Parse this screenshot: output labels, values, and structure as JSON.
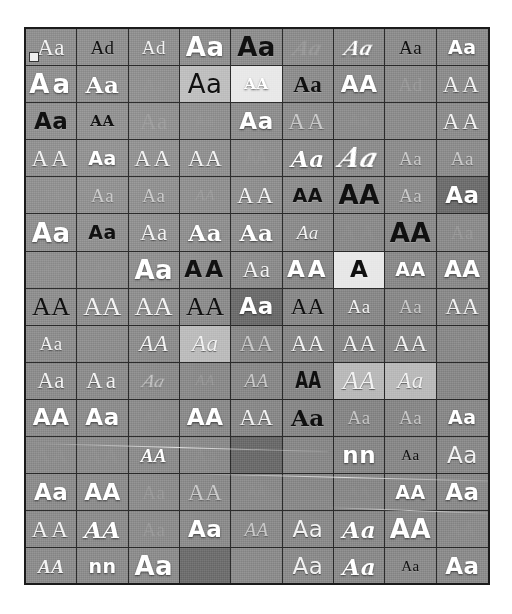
{
  "window": {
    "title": "Font Gallery",
    "panel_name": "font-preview-grid",
    "background_color": "#ffffff",
    "panel_background_color": "#8d8d8d",
    "grid_line_color": "#2a2a2a",
    "frame_border_color": "#1b1b1b"
  },
  "grid": {
    "columns": 9,
    "rows": 15,
    "total_cells": 135,
    "filled_cells": 130,
    "empty_cells": 5,
    "sample_text_default": "Aa",
    "selected_index": 0,
    "selection_badge_name": "selection-marker"
  },
  "cells": [
    {
      "text": "Aa",
      "cls": "f-serif sz-lg t-white"
    },
    {
      "text": "Ad",
      "cls": "f-serif sz-md t-dark"
    },
    {
      "text": "Ad",
      "cls": "f-serif sz-md t-white"
    },
    {
      "text": "Aa",
      "cls": "f-dsans w-bold sz-xl t-bright"
    },
    {
      "text": "Aa",
      "cls": "f-dsans w-bold sz-xl t-dark"
    },
    {
      "text": "Aa",
      "cls": "f-serif i-italic w-bold sz-lg t-faint slant"
    },
    {
      "text": "Aa",
      "cls": "f-serif i-italic w-bold sz-lg t-bright slant"
    },
    {
      "text": "Aa",
      "cls": "f-serif sz-md t-dark"
    },
    {
      "text": "Aa",
      "cls": "f-dsans w-bold sz-md t-bright"
    },
    {
      "text": "Aa",
      "cls": "f-dsans w-bold sz-xl t-bright wide"
    },
    {
      "text": "Aa",
      "cls": "f-dserif w-bold sz-lg t-bright"
    },
    {
      "text": "Aa",
      "cls": "f-serif sz-md t-ghost"
    },
    {
      "text": "Aa",
      "cls": "f-dsans sz-xl t-dark bg-lighter"
    },
    {
      "text": "AA",
      "cls": "f-dserif w-bold sz-sm t-bright bg-light"
    },
    {
      "text": "Aa",
      "cls": "f-serif w-bold sz-lg t-dark"
    },
    {
      "text": "AA",
      "cls": "f-dsans w-bold sz-lg t-bright"
    },
    {
      "text": "Ad",
      "cls": "f-serif sz-md t-faint"
    },
    {
      "text": "AA",
      "cls": "f-serif sz-lg t-white wide"
    },
    {
      "text": "Aa",
      "cls": "f-dsans w-bold sz-lg t-dark"
    },
    {
      "text": "AA",
      "cls": "f-dserif w-bold sz-sm t-dark blurry"
    },
    {
      "text": "Aa",
      "cls": "f-serif sz-lg t-faint"
    },
    {
      "text": "Aa",
      "cls": "f-dmono sz-sm t-ghost"
    },
    {
      "text": "Aa",
      "cls": "f-dsans w-bold sz-lg t-bright"
    },
    {
      "text": "AA",
      "cls": "f-serif sz-lg t-mid wide"
    },
    {
      "text": "Aa",
      "cls": "f-dsans sz-sm t-ghost"
    },
    {
      "text": "",
      "cls": "f-serif sz-sm t-ghost"
    },
    {
      "text": "AA",
      "cls": "f-serif sz-lg t-white wide"
    },
    {
      "text": "AA",
      "cls": "f-serif sz-lg t-white wide"
    },
    {
      "text": "Aa",
      "cls": "f-dsans w-bold sz-md t-bright"
    },
    {
      "text": "AA",
      "cls": "f-serif sz-lg t-white wide"
    },
    {
      "text": "AA",
      "cls": "f-serif sz-lg t-white"
    },
    {
      "text": "AA",
      "cls": "f-mono sz-lg t-ghost cond"
    },
    {
      "text": "Aa",
      "cls": "f-dserif i-italic w-bold sz-lg t-bright"
    },
    {
      "text": "Aa",
      "cls": "f-dserif i-italic w-bold sz-xl t-bright slant"
    },
    {
      "text": "Aa",
      "cls": "f-serif sz-md t-mid"
    },
    {
      "text": "Aa",
      "cls": "f-serif sz-md t-mid"
    },
    {
      "text": "AA",
      "cls": "f-serif i-italic sz-sm t-ghost"
    },
    {
      "text": "Aa",
      "cls": "f-serif sz-md t-mid"
    },
    {
      "text": "Aa",
      "cls": "f-serif sz-md t-mid"
    },
    {
      "text": "AA",
      "cls": "f-serif i-italic sz-sm t-faint"
    },
    {
      "text": "AA",
      "cls": "f-serif sz-lg t-white wide"
    },
    {
      "text": "AA",
      "cls": "f-dsans w-bold sz-md t-dark"
    },
    {
      "text": "AA",
      "cls": "f-dsans w-bold sz-xl t-dark"
    },
    {
      "text": "Aa",
      "cls": "f-serif sz-md t-mid"
    },
    {
      "text": "Aa",
      "cls": "f-dsans w-bold sz-lg t-bright bg-dark"
    },
    {
      "text": "Aa",
      "cls": "f-dsans w-bold sz-xl t-bright"
    },
    {
      "text": "Aa",
      "cls": "f-dsans w-bold sz-md t-dark"
    },
    {
      "text": "Aa",
      "cls": "f-serif sz-lg t-white"
    },
    {
      "text": "Aa",
      "cls": "f-dserif w-bold sz-lg t-bright"
    },
    {
      "text": "Aa",
      "cls": "f-dserif w-bold sz-lg t-bright"
    },
    {
      "text": "Aa",
      "cls": "f-serif i-italic sz-md t-white"
    },
    {
      "text": "AA",
      "cls": "f-serif sz-lg t-ghost wide"
    },
    {
      "text": "AA",
      "cls": "f-dsans w-bold sz-xl t-dark"
    },
    {
      "text": "Aa",
      "cls": "f-serif sz-md t-faint"
    },
    {
      "text": "Ad",
      "cls": "f-serif sz-sm t-ghost"
    },
    {
      "text": "Aa",
      "cls": "f-serif sz-sm t-ghost"
    },
    {
      "text": "Aa",
      "cls": "f-dsans w-bold sz-xl t-bright"
    },
    {
      "text": "AA",
      "cls": "f-dsans w-bold sz-lg t-dark wide"
    },
    {
      "text": "Aa",
      "cls": "f-serif sz-lg t-white"
    },
    {
      "text": "AA",
      "cls": "f-dsans w-bold sz-lg t-bright wide"
    },
    {
      "text": "A",
      "cls": "f-dsans w-bold sz-lg t-dark bg-light"
    },
    {
      "text": "AA",
      "cls": "f-dsans w-bold sz-md t-bright"
    },
    {
      "text": "AA",
      "cls": "f-dsans w-bold sz-lg t-bright"
    },
    {
      "text": "AA",
      "cls": "f-serif sz-xl t-dark"
    },
    {
      "text": "AA",
      "cls": "f-serif sz-xl t-white"
    },
    {
      "text": "AA",
      "cls": "f-serif sz-xl t-white"
    },
    {
      "text": "AA",
      "cls": "f-serif sz-xl t-dark"
    },
    {
      "text": "Aa",
      "cls": "f-dsans w-bold sz-lg t-bright bg-dark"
    },
    {
      "text": "AA",
      "cls": "f-serif sz-lg t-dark"
    },
    {
      "text": "Aa",
      "cls": "f-serif sz-md t-white"
    },
    {
      "text": "Aa",
      "cls": "f-serif sz-md t-mid"
    },
    {
      "text": "AA",
      "cls": "f-serif sz-lg t-white"
    },
    {
      "text": "Aa",
      "cls": "f-serif sz-md t-white blurry"
    },
    {
      "text": "",
      "cls": "f-serif sz-md t-ghost"
    },
    {
      "text": "AA",
      "cls": "f-serif i-italic sz-lg t-white"
    },
    {
      "text": "Aa",
      "cls": "f-serif i-italic sz-lg t-white bg-lighter"
    },
    {
      "text": "AA",
      "cls": "f-serif sz-lg t-mid"
    },
    {
      "text": "AA",
      "cls": "f-serif sz-lg t-white"
    },
    {
      "text": "AA",
      "cls": "f-serif sz-lg t-white"
    },
    {
      "text": "AA",
      "cls": "f-serif sz-lg t-white"
    },
    {
      "text": "Aa",
      "cls": "f-serif sz-sm t-ghost"
    },
    {
      "text": "Aa",
      "cls": "f-serif sz-lg t-white"
    },
    {
      "text": "Aa",
      "cls": "f-serif sz-lg t-white wide"
    },
    {
      "text": "Aa",
      "cls": "f-serif i-italic sz-md t-mid slant"
    },
    {
      "text": "AA",
      "cls": "f-serif i-italic sz-sm t-faint"
    },
    {
      "text": "AA",
      "cls": "f-serif i-italic sz-md t-mid"
    },
    {
      "text": "AA",
      "cls": "f-dsans w-bold sz-lg t-dark cond"
    },
    {
      "text": "AA",
      "cls": "f-serif i-italic sz-xl t-white bg-lighter"
    },
    {
      "text": "Aa",
      "cls": "f-serif i-italic sz-lg t-white bg-lighter"
    },
    {
      "text": "",
      "cls": "f-serif sz-md t-ghost"
    },
    {
      "text": "AA",
      "cls": "f-dsans w-bold sz-lg t-bright"
    },
    {
      "text": "Aa",
      "cls": "f-dsans w-bold sz-lg t-bright"
    },
    {
      "text": "AA",
      "cls": "f-serif sz-sm t-ghost"
    },
    {
      "text": "AA",
      "cls": "f-dsans w-bold sz-lg t-bright"
    },
    {
      "text": "AA",
      "cls": "f-serif sz-lg t-white"
    },
    {
      "text": "Aa",
      "cls": "f-dserif w-bold sz-lg t-dark"
    },
    {
      "text": "Aa",
      "cls": "f-serif sz-md t-mid"
    },
    {
      "text": "Aa",
      "cls": "f-serif sz-md t-mid"
    },
    {
      "text": "Aa",
      "cls": "f-dsans w-bold sz-md t-bright"
    },
    {
      "text": "AA",
      "cls": "f-serif sz-lg t-ghost"
    },
    {
      "text": "AA",
      "cls": "f-serif sz-lg t-ghost"
    },
    {
      "text": "AA",
      "cls": "f-serif i-italic w-bold sz-md t-bright"
    },
    {
      "text": "Aa",
      "cls": "f-serif sz-md t-ghost"
    },
    {
      "text": "",
      "cls": "f-serif sz-md t-ghost blurry bg-dark"
    },
    {
      "text": "",
      "cls": "f-serif sz-md t-ghost"
    },
    {
      "text": "nn",
      "cls": "f-dsans w-bold sz-lg t-bright"
    },
    {
      "text": "Aa",
      "cls": "f-serif sz-sm t-dark"
    },
    {
      "text": "Aa",
      "cls": "f-dsans sz-lg t-white"
    },
    {
      "text": "Aa",
      "cls": "f-dsans w-bold sz-lg t-bright"
    },
    {
      "text": "AA",
      "cls": "f-dsans w-bold sz-lg t-bright"
    },
    {
      "text": "Aa",
      "cls": "f-serif sz-md t-faint"
    },
    {
      "text": "AA",
      "cls": "f-serif sz-lg t-mid"
    },
    {
      "text": "AA",
      "cls": "f-mono sz-md t-ghost cond"
    },
    {
      "text": "",
      "cls": "f-serif sz-md t-ghost"
    },
    {
      "text": "AA",
      "cls": "f-serif sz-sm t-ghost"
    },
    {
      "text": "AA",
      "cls": "f-dsans w-bold sz-md t-bright"
    },
    {
      "text": "Aa",
      "cls": "f-dsans w-bold sz-lg t-bright"
    },
    {
      "text": "AA",
      "cls": "f-serif sz-lg t-white wide"
    },
    {
      "text": "AA",
      "cls": "f-dserif i-italic w-bold sz-lg t-bright"
    },
    {
      "text": "Aa",
      "cls": "f-serif sz-md t-faint"
    },
    {
      "text": "Aa",
      "cls": "f-dsans w-bold sz-lg t-bright"
    },
    {
      "text": "AA",
      "cls": "f-serif i-italic sz-md t-mid"
    },
    {
      "text": "Aa",
      "cls": "f-dsans sz-lg t-white"
    },
    {
      "text": "Aa",
      "cls": "f-dserif i-italic w-bold sz-lg t-bright"
    },
    {
      "text": "AA",
      "cls": "f-dsans w-bold sz-xl t-bright"
    },
    {
      "text": "AA",
      "cls": "f-serif sz-md t-ghost"
    },
    {
      "text": "AA",
      "cls": "f-serif i-italic w-bold sz-md t-white"
    },
    {
      "text": "nn",
      "cls": "f-dsans w-bold sz-md t-bright"
    },
    {
      "text": "Aa",
      "cls": "f-dsans w-bold sz-xl t-bright"
    },
    {
      "text": "",
      "cls": "f-serif sz-md t-ghost blurry bg-dark"
    },
    {
      "text": "",
      "cls": "f-serif sz-md t-ghost"
    },
    {
      "text": "Aa",
      "cls": "f-dsans sz-lg t-white"
    },
    {
      "text": "Aa",
      "cls": "f-dserif i-italic w-bold sz-lg t-bright"
    },
    {
      "text": "Aa",
      "cls": "f-serif sz-sm t-dark blurry"
    },
    {
      "text": "Aa",
      "cls": "f-dsans w-bold sz-lg t-bright"
    },
    {
      "text": "Aa",
      "cls": "f-serif sz-md t-faint"
    },
    {
      "text": "Aa",
      "cls": "f-serif sz-sm t-ghost"
    },
    {
      "text": "AA",
      "cls": "f-dsans w-bold sz-xl t-bright bg-dark"
    },
    {
      "text": "AA",
      "cls": "f-serif sz-lg t-white"
    },
    {
      "text": "",
      "cls": "empty"
    },
    {
      "text": "",
      "cls": "empty"
    },
    {
      "text": "",
      "cls": "empty"
    },
    {
      "text": "",
      "cls": "empty"
    },
    {
      "text": "",
      "cls": "empty"
    }
  ]
}
